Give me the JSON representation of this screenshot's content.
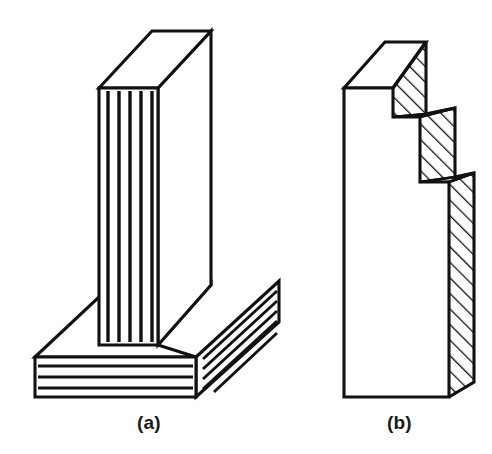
{
  "figure": {
    "type": "engineering-isometric-line-drawing",
    "background_color": "#ffffff",
    "line_color": "#111111",
    "canvas": {
      "width": 492,
      "height": 454
    }
  },
  "captions": [
    {
      "id": "a",
      "label": "(a)",
      "x": 155,
      "y": 425
    },
    {
      "id": "b",
      "label": "(b)",
      "x": 405,
      "y": 425
    }
  ],
  "part_a": {
    "label": "(a)",
    "name": "L-shaped-bracket-with-ribbed-faces",
    "components": [
      {
        "name": "vertical-slab",
        "top_face": {
          "shape": "parallelogram",
          "points": [
            [
              99,
              88
            ],
            [
              152,
              31
            ],
            [
              211,
              31
            ],
            [
              158,
              88
            ]
          ]
        },
        "front_face": {
          "shape": "rectangle",
          "points": [
            [
              99,
              88
            ],
            [
              158,
              88
            ],
            [
              158,
              345
            ],
            [
              99,
              345
            ]
          ],
          "pattern": "vertical-stripes",
          "stripe_count": 5
        },
        "right_face": {
          "shape": "quadrilateral",
          "points": [
            [
              158,
              88
            ],
            [
              211,
              31
            ],
            [
              211,
              285
            ],
            [
              158,
              345
            ]
          ],
          "pattern": "plain-white"
        }
      },
      {
        "name": "horizontal-base-slab",
        "top_face": {
          "shape": "parallelogram-with-notch",
          "pattern": "plain-white"
        },
        "front_face": {
          "shape": "rectangle",
          "points": [
            [
              35,
              357
            ],
            [
              196,
              357
            ],
            [
              196,
              397
            ],
            [
              35,
              397
            ]
          ],
          "pattern": "horizontal-stripes",
          "stripe_count": 3
        },
        "right_end_face": {
          "shape": "parallelogram",
          "points": [
            [
              196,
              357
            ],
            [
              279,
              281
            ],
            [
              279,
              322
            ],
            [
              196,
              397
            ]
          ],
          "pattern": "diagonal-stripes",
          "stripe_count": 5
        }
      }
    ],
    "stripe_pattern": {
      "front_vertical": {
        "count": 5,
        "x_positions": [
          108,
          119,
          130,
          141,
          152
        ],
        "y_top": 90,
        "y_bottom": 343,
        "color": "#111111"
      },
      "base_horizontal": {
        "count": 3,
        "y_positions": [
          366,
          377,
          388
        ],
        "x_left": 38,
        "x_right": 193,
        "color": "#111111"
      },
      "base_diagonal": {
        "count": 5,
        "color": "#111111"
      }
    }
  },
  "part_b": {
    "label": "(b)",
    "name": "three-step-stepped-block",
    "step_count": 3,
    "front_face": {
      "shape": "stepped-polygon",
      "pattern": "plain-white",
      "points": [
        [
          344,
          88
        ],
        [
          393,
          88
        ],
        [
          393,
          117
        ],
        [
          420,
          117
        ],
        [
          420,
          182
        ],
        [
          449,
          182
        ],
        [
          449,
          397
        ],
        [
          344,
          397
        ]
      ]
    },
    "top_faces": [
      {
        "step": 1,
        "points": [
          [
            344,
            88
          ],
          [
            385,
            42
          ],
          [
            426,
            42
          ],
          [
            393,
            88
          ]
        ],
        "pattern": "plain-white"
      },
      {
        "step": 2,
        "points": [
          [
            393,
            117
          ],
          [
            432,
            108
          ],
          [
            455,
            108
          ],
          [
            420,
            117
          ]
        ],
        "pattern": "plain-white"
      },
      {
        "step": 3,
        "points": [
          [
            420,
            182
          ],
          [
            455,
            173
          ],
          [
            474,
            173
          ],
          [
            449,
            182
          ]
        ],
        "pattern": "plain-white"
      }
    ],
    "side_faces": [
      {
        "step": 1,
        "pattern": "diagonal-hatching"
      },
      {
        "step": 2,
        "pattern": "diagonal-hatching"
      },
      {
        "step": 3,
        "pattern": "diagonal-hatching"
      }
    ],
    "hatching": {
      "angle_degrees": 45,
      "direction": "lower-left-to-upper-right",
      "color": "#111111",
      "spacing_px": 11
    }
  }
}
